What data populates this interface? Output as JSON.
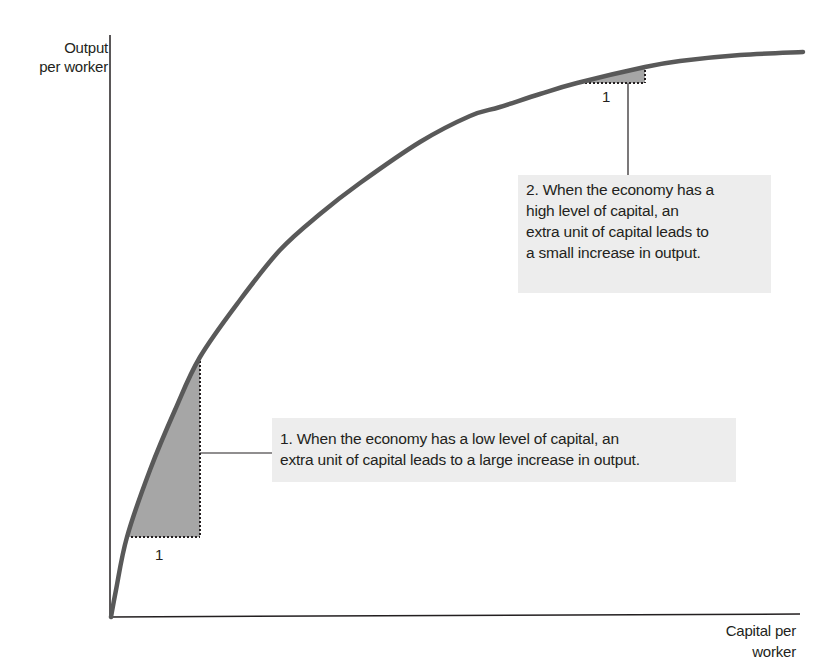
{
  "chart_data": {
    "type": "line",
    "title": "",
    "xlabel": "Capital per worker",
    "ylabel": "Output per worker",
    "xlabel_lines": [
      "Capital per",
      "worker"
    ],
    "ylabel_lines": [
      "Output",
      "per worker"
    ],
    "grid": false,
    "ticks": "none",
    "series": [
      {
        "name": "Production function",
        "description": "Concave curve showing diminishing returns to capital",
        "color": "#595959"
      }
    ],
    "annotations": [
      {
        "id": "low-capital",
        "unit_label": "1",
        "text": "1. When the economy has a low level of capital, an extra unit of capital leads to a large increase in output.",
        "lines": [
          "1. When the economy has a low level of capital, an",
          "extra unit of capital leads to a large increase in output."
        ]
      },
      {
        "id": "high-capital",
        "unit_label": "1",
        "text": "2. When the economy has a high level of capital, an extra unit of capital leads to a small increase in output.",
        "lines": [
          "2. When the economy has a",
          "high level of capital, an",
          "extra unit of capital leads to",
          "a small increase in output."
        ]
      }
    ]
  },
  "colors": {
    "curve": "#595959",
    "axis": "#231f20",
    "shade": "#a6a6a6",
    "box": "#ededed"
  }
}
